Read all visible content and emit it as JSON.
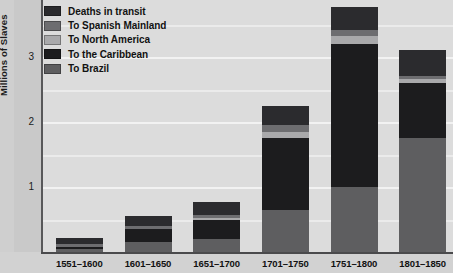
{
  "chart_data": {
    "type": "bar",
    "title": "",
    "subtitle": "",
    "xlabel": "",
    "ylabel": "Millions of Slaves",
    "stacked": true,
    "grid": true,
    "legend_position": "top-left",
    "ylim": [
      0,
      4
    ],
    "yticks": [
      1,
      2,
      3
    ],
    "ytick_labels": [
      "1",
      "2",
      "3"
    ],
    "categories": [
      "1551–1600",
      "1601–1650",
      "1651–1700",
      "1701–1750",
      "1751–1800",
      "1801–1850"
    ],
    "series": [
      {
        "name": "To Brazil",
        "color": "#5e5e60",
        "values": [
          0.05,
          0.15,
          0.2,
          0.65,
          1.0,
          1.75
        ]
      },
      {
        "name": "To the Caribbean",
        "color": "#1c1c1e",
        "values": [
          0.03,
          0.2,
          0.3,
          1.1,
          2.2,
          0.85
        ]
      },
      {
        "name": "To North America",
        "color": "#a9a9ab",
        "values": [
          0.0,
          0.0,
          0.02,
          0.1,
          0.12,
          0.06
        ]
      },
      {
        "name": "To Spanish Mainland",
        "color": "#6d6d70",
        "values": [
          0.05,
          0.05,
          0.05,
          0.1,
          0.1,
          0.05
        ]
      },
      {
        "name": "Deaths in transit",
        "color": "#2b2b2e",
        "values": [
          0.08,
          0.15,
          0.2,
          0.3,
          0.35,
          0.4
        ]
      }
    ],
    "legend_order_top_to_bottom": [
      "Deaths in transit",
      "To Spanish Mainland",
      "To North America",
      "To the Caribbean",
      "To Brazil"
    ]
  },
  "colors": {
    "plot_background": "#dcdcdc",
    "figure_background": "#c9c9c9",
    "gridline": "#f2f2f2",
    "axis": "#58585a",
    "text": "#121212"
  }
}
